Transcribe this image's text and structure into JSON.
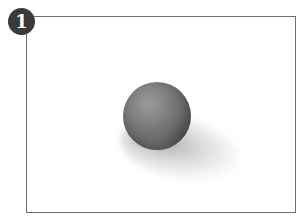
{
  "figure": {
    "step_number": "1",
    "colors": {
      "frame_border": "#6e6e6e",
      "badge_background": "#3a3a3a",
      "badge_text": "#ffffff",
      "sphere_mid": "#7c7c7c",
      "background": "#ffffff"
    }
  }
}
